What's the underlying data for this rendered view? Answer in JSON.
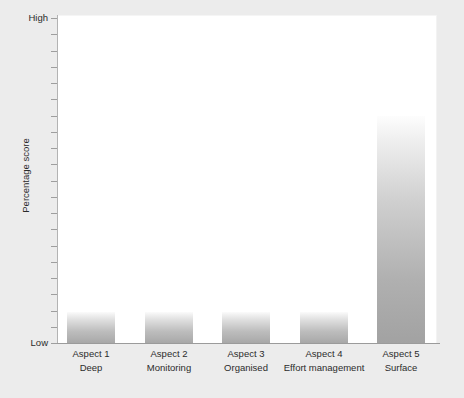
{
  "chart_data": {
    "type": "bar",
    "title": "",
    "xlabel": "",
    "ylabel": "Percentage score",
    "categories": [
      "Aspect 1",
      "Aspect 2",
      "Aspect 3",
      "Aspect 4",
      "Aspect 5"
    ],
    "category_sublabels": [
      "Deep",
      "Monitoring",
      "Organised",
      "Effort management",
      "Surface"
    ],
    "values": [
      9.5,
      9.5,
      9.5,
      9.5,
      70
    ],
    "ylim": [
      0,
      100
    ],
    "ytick_labels": [
      "Low",
      "High"
    ],
    "y_axis_low_label": "Low",
    "y_axis_high_label": "High",
    "grid": false,
    "legend": "none",
    "bar_fill": "gray-vertical-gradient",
    "colors": {
      "page_background": "#ececec",
      "plot_background": "#ffffff",
      "axis": "#9b9b9b",
      "bar_top": "#fbfbfb",
      "bar_bottom": "#a8a8a8",
      "text": "#2b2b2b"
    }
  },
  "axis": {
    "y_label": "Percentage score",
    "high": "High",
    "low": "Low"
  },
  "categories": [
    {
      "name": "Aspect 1",
      "sub": "Deep"
    },
    {
      "name": "Aspect 2",
      "sub": "Monitoring"
    },
    {
      "name": "Aspect 3",
      "sub": "Organised"
    },
    {
      "name": "Aspect 4",
      "sub": "Effort management"
    },
    {
      "name": "Aspect 5",
      "sub": "Surface"
    }
  ]
}
